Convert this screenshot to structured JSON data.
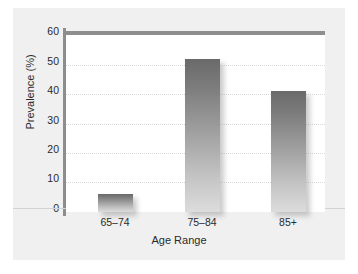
{
  "chart_data": {
    "type": "bar",
    "title": "",
    "xlabel": "Age Range",
    "ylabel": "Prevalence (%)",
    "categories": [
      "65–74",
      "75–84",
      "85+"
    ],
    "values": [
      6,
      52,
      41
    ],
    "ylim": [
      0,
      60
    ],
    "yticks": [
      0,
      10,
      20,
      30,
      40,
      50,
      60
    ],
    "ytick_labels": [
      "0",
      "10",
      "20",
      "30",
      "40",
      "50",
      "60"
    ],
    "grid": "horizontal-dotted",
    "legend": null,
    "bar_color_top": "#6a6a6a",
    "bar_color_bottom": "#dcdcdc",
    "figure_background": "#f0f0f0",
    "plot_background": "#ffffff",
    "axis_color": "#8d8d8d",
    "gridline_color": "#d9d9d9"
  }
}
